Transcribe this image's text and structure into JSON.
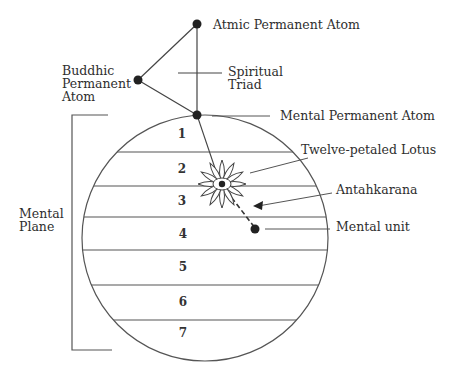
{
  "diagram": {
    "labels": {
      "atmic": "Atmic Permanent Atom",
      "buddhic_1": "Buddhic",
      "buddhic_2": "Permanent",
      "buddhic_3": "Atom",
      "triad_1": "Spiritual",
      "triad_2": "Triad",
      "mental_atom": "Mental Permanent Atom",
      "lotus": "Twelve-petaled Lotus",
      "antahkarana": "Antahkarana",
      "mental_unit": "Mental unit",
      "plane_1": "Mental",
      "plane_2": "Plane"
    },
    "subplanes": [
      "1",
      "2",
      "3",
      "4",
      "5",
      "6",
      "7"
    ]
  }
}
